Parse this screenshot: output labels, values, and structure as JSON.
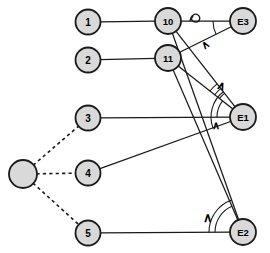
{
  "diagram": {
    "background": "#ffffff",
    "node_fill": "#d9d9d9",
    "node_stroke": "#1a1a1a",
    "edge_color": "#1a1a1a",
    "label_color": "#000000",
    "nodes": [
      {
        "id": "n1",
        "label": "1",
        "cx": 88,
        "cy": 22,
        "r": 12.5,
        "labeled": true
      },
      {
        "id": "n2",
        "label": "2",
        "cx": 88,
        "cy": 60,
        "r": 12.5,
        "labeled": true
      },
      {
        "id": "n3",
        "label": "3",
        "cx": 88,
        "cy": 118,
        "r": 12.5,
        "labeled": true
      },
      {
        "id": "n4",
        "label": "4",
        "cx": 88,
        "cy": 173,
        "r": 12.5,
        "labeled": true
      },
      {
        "id": "n5",
        "label": "5",
        "cx": 88,
        "cy": 233,
        "r": 12.5,
        "labeled": true
      },
      {
        "id": "hub",
        "label": "",
        "cx": 23,
        "cy": 174,
        "r": 14.0,
        "labeled": false
      },
      {
        "id": "n10",
        "label": "10",
        "cx": 168,
        "cy": 21,
        "r": 13.0,
        "labeled": true
      },
      {
        "id": "n11",
        "label": "11",
        "cx": 168,
        "cy": 58,
        "r": 13.0,
        "labeled": true
      },
      {
        "id": "e3",
        "label": "E3",
        "cx": 243,
        "cy": 21,
        "r": 13.0,
        "labeled": true
      },
      {
        "id": "e1",
        "label": "E1",
        "cx": 243,
        "cy": 117,
        "r": 13.0,
        "labeled": true
      },
      {
        "id": "e2",
        "label": "E2",
        "cx": 243,
        "cy": 232,
        "r": 13.0,
        "labeled": true
      }
    ],
    "edges": [
      {
        "from": "n1",
        "to": "n10",
        "style": "solid"
      },
      {
        "from": "n2",
        "to": "n11",
        "style": "solid"
      },
      {
        "from": "n10",
        "to": "e3",
        "style": "solid"
      },
      {
        "from": "n10",
        "to": "e1",
        "style": "solid"
      },
      {
        "from": "n10",
        "to": "e2",
        "style": "solid"
      },
      {
        "from": "n11",
        "to": "e3",
        "style": "solid"
      },
      {
        "from": "n11",
        "to": "e1",
        "style": "solid"
      },
      {
        "from": "n11",
        "to": "e2",
        "style": "solid"
      },
      {
        "from": "n3",
        "to": "e1",
        "style": "solid"
      },
      {
        "from": "n4",
        "to": "e1",
        "style": "solid"
      },
      {
        "from": "n5",
        "to": "e2",
        "style": "solid"
      },
      {
        "from": "hub",
        "to": "n3",
        "style": "dashed"
      },
      {
        "from": "hub",
        "to": "n4",
        "style": "dashed"
      },
      {
        "from": "hub",
        "to": "n5",
        "style": "dashed"
      }
    ],
    "angle_marks": [
      {
        "id": "mark-e3",
        "glyph": "∧",
        "x": 205,
        "y": 44,
        "rotation": -35,
        "size": 11
      },
      {
        "id": "mark-e1-upper",
        "glyph": "∧",
        "x": 222,
        "y": 86,
        "rotation": 20,
        "size": 12
      },
      {
        "id": "mark-e1-lower",
        "glyph": "∧",
        "x": 216,
        "y": 125,
        "rotation": 0,
        "size": 11
      },
      {
        "id": "mark-e2",
        "glyph": "∧",
        "x": 208,
        "y": 217,
        "rotation": 0,
        "size": 13
      }
    ],
    "loop_marker": {
      "id": "loop-on-edge-10-e3",
      "cx": 197,
      "cy": 17
    }
  }
}
